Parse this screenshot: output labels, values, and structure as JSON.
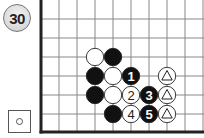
{
  "problem": {
    "number": "30",
    "legend_symbol": "white-stone-to-play",
    "colors": {
      "black": "#111111",
      "white": "#ffffff",
      "grid": "#888888",
      "edge": "#222222"
    }
  },
  "board": {
    "origin_x": 41,
    "origin_y": 19,
    "spacing_x": 18,
    "spacing_y": 19,
    "cols": 10,
    "rows": 7,
    "stones": [
      {
        "col": 3,
        "row": 2,
        "color": "white",
        "label": ""
      },
      {
        "col": 4,
        "row": 2,
        "color": "black",
        "label": ""
      },
      {
        "col": 3,
        "row": 3,
        "color": "black",
        "label": ""
      },
      {
        "col": 4,
        "row": 3,
        "color": "white",
        "label": ""
      },
      {
        "col": 5,
        "row": 3,
        "color": "black",
        "label": "1"
      },
      {
        "col": 7,
        "row": 3,
        "color": "white",
        "label": "triangle"
      },
      {
        "col": 3,
        "row": 4,
        "color": "black",
        "label": ""
      },
      {
        "col": 4,
        "row": 4,
        "color": "white",
        "label": ""
      },
      {
        "col": 5,
        "row": 4,
        "color": "white",
        "label": "2"
      },
      {
        "col": 6,
        "row": 4,
        "color": "black",
        "label": "3"
      },
      {
        "col": 7,
        "row": 4,
        "color": "white",
        "label": "triangle"
      },
      {
        "col": 4,
        "row": 5,
        "color": "black",
        "label": ""
      },
      {
        "col": 5,
        "row": 5,
        "color": "white",
        "label": "4"
      },
      {
        "col": 6,
        "row": 5,
        "color": "black",
        "label": "5"
      },
      {
        "col": 7,
        "row": 5,
        "color": "white",
        "label": "triangle"
      }
    ]
  }
}
